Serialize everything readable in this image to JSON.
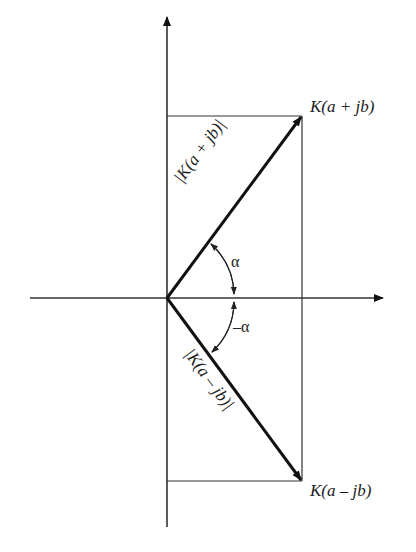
{
  "diagram": {
    "type": "complex-plane-vector-diagram",
    "colors": {
      "line": "#333333",
      "vector": "#111111",
      "background": "#ffffff"
    },
    "points": {
      "upper": {
        "label": "K(a + jb)"
      },
      "lower": {
        "label": "K(a – jb)"
      }
    },
    "vectors": {
      "upper_magnitude": "|K(a + jb)|",
      "lower_magnitude": "|K(a – jb)|"
    },
    "angles": {
      "positive": "α",
      "negative": "–α"
    }
  }
}
